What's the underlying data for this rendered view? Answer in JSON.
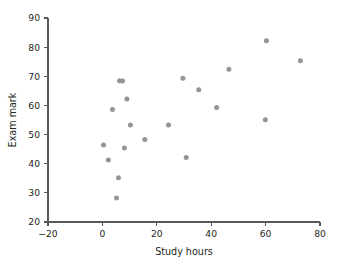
{
  "chart_data": {
    "type": "scatter",
    "title": "",
    "xlabel": "Study hours",
    "ylabel": "Exam mark",
    "xlim": [
      -20,
      80
    ],
    "ylim": [
      20,
      90
    ],
    "xticks": [
      -20,
      0,
      20,
      40,
      60,
      80
    ],
    "yticks": [
      20,
      30,
      40,
      50,
      60,
      70,
      80,
      90
    ],
    "xtick_labels": [
      "−20",
      "0",
      "20",
      "40",
      "60",
      "80"
    ],
    "ytick_labels": [
      "20",
      "30",
      "40",
      "50",
      "60",
      "70",
      "80",
      "90"
    ],
    "grid": false,
    "legend": null,
    "marker_color": "#939598",
    "axis_color": "#58595b",
    "points": [
      {
        "x": 0.4,
        "y": 46.4
      },
      {
        "x": 2.2,
        "y": 41.3
      },
      {
        "x": 3.7,
        "y": 58.6
      },
      {
        "x": 5.2,
        "y": 28.2
      },
      {
        "x": 5.9,
        "y": 35.2
      },
      {
        "x": 6.3,
        "y": 68.5
      },
      {
        "x": 7.4,
        "y": 68.4
      },
      {
        "x": 8.1,
        "y": 45.4
      },
      {
        "x": 9.0,
        "y": 62.2
      },
      {
        "x": 10.3,
        "y": 53.3
      },
      {
        "x": 15.6,
        "y": 48.3
      },
      {
        "x": 24.3,
        "y": 53.3
      },
      {
        "x": 29.6,
        "y": 69.3
      },
      {
        "x": 30.8,
        "y": 42.1
      },
      {
        "x": 35.4,
        "y": 65.4
      },
      {
        "x": 42.0,
        "y": 59.3
      },
      {
        "x": 46.5,
        "y": 72.4
      },
      {
        "x": 59.9,
        "y": 55.1
      },
      {
        "x": 60.3,
        "y": 82.2
      },
      {
        "x": 72.8,
        "y": 75.3
      }
    ]
  }
}
